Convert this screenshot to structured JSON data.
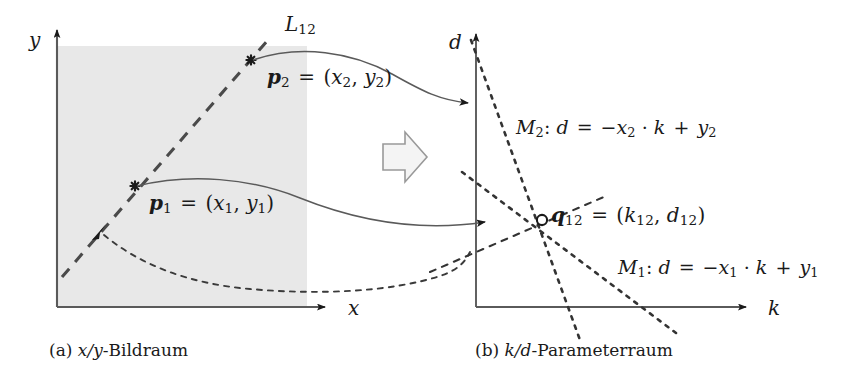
{
  "figure": {
    "background_color": "#ffffff",
    "ink_color": "#1a1a1a",
    "image_region_fill": "#e8e8e8",
    "line_color": "#3a3a3a"
  },
  "panel_a": {
    "caption_prefix": "(a)",
    "caption_math": "x/y",
    "caption_text": "-Bildraum",
    "axis_x_label": "x",
    "axis_y_label": "y",
    "line_label": {
      "base": "L",
      "sub": "12"
    },
    "point_1": {
      "name": "p",
      "name_sub": "1",
      "equals": "=",
      "coords_open": "(",
      "coord_x": "x",
      "coord_x_sub": "1",
      "comma": ",",
      "coord_y": "y",
      "coord_y_sub": "1",
      "coords_close": ")"
    },
    "point_2": {
      "name": "p",
      "name_sub": "2",
      "equals": "=",
      "coords_open": "(",
      "coord_x": "x",
      "coord_x_sub": "2",
      "comma": ",",
      "coord_y": "y",
      "coord_y_sub": "2",
      "coords_close": ")"
    }
  },
  "panel_b": {
    "caption_prefix": "(b)",
    "caption_math": "k/d",
    "caption_text": "-Parameterraum",
    "axis_x_label": "k",
    "axis_y_label": "d",
    "line_m1": {
      "name": "M",
      "name_sub": "1",
      "colon": ":",
      "lhs": "d",
      "equals": "=",
      "minus": "−",
      "var_x": "x",
      "var_x_sub": "1",
      "dot": "·",
      "var_k": "k",
      "plus": "+",
      "var_y": "y",
      "var_y_sub": "1"
    },
    "line_m2": {
      "name": "M",
      "name_sub": "2",
      "colon": ":",
      "lhs": "d",
      "equals": "=",
      "minus": "−",
      "var_x": "x",
      "var_x_sub": "2",
      "dot": "·",
      "var_k": "k",
      "plus": "+",
      "var_y": "y",
      "var_y_sub": "2"
    },
    "intersection_point": {
      "name": "q",
      "name_sub": "12",
      "equals": "=",
      "coords_open": "(",
      "coord_k": "k",
      "coord_k_sub": "12",
      "comma": ",",
      "coord_d": "d",
      "coord_d_sub": "12",
      "coords_close": ")"
    }
  },
  "transform_arrow": {
    "name": "block-arrow-right"
  }
}
